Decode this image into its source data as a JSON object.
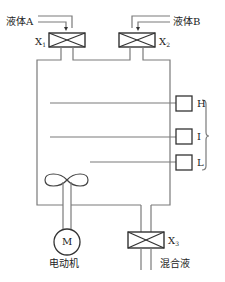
{
  "diagram": {
    "title": "",
    "inputs": [
      {
        "id": "A",
        "label": "液体A",
        "valve": "X",
        "valve_sub": "1"
      },
      {
        "id": "B",
        "label": "液体B",
        "valve": "X",
        "valve_sub": "2"
      }
    ],
    "sensors": [
      {
        "id": "H",
        "label": "H"
      },
      {
        "id": "I",
        "label": "I"
      },
      {
        "id": "L",
        "label": "L"
      }
    ],
    "motor": {
      "symbol": "M",
      "label": "电动机"
    },
    "outlet": {
      "valve": "X",
      "valve_sub": "3",
      "label": "混合液"
    },
    "colors": {
      "line": "#7a7a7a",
      "text": "#222222"
    }
  }
}
